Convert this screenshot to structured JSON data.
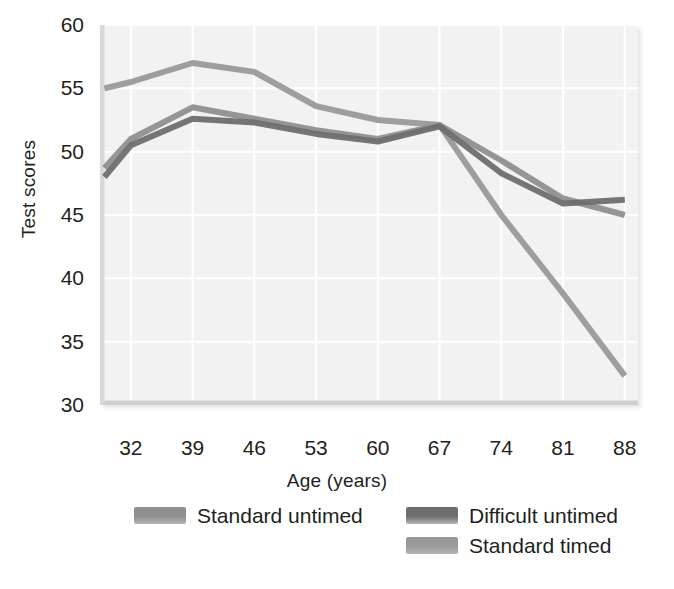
{
  "chart_data": {
    "type": "line",
    "title": "",
    "xlabel": "Age (years)",
    "ylabel": "Test scores",
    "x": [
      32,
      39,
      46,
      53,
      60,
      67,
      74,
      81,
      88
    ],
    "categories": [
      "32",
      "39",
      "46",
      "53",
      "60",
      "67",
      "74",
      "81",
      "88"
    ],
    "xlim": [
      28.5,
      89.5
    ],
    "ylim": [
      30,
      60
    ],
    "yticks": [
      30,
      35,
      40,
      45,
      50,
      55,
      60
    ],
    "ytick_labels": [
      "30",
      "35",
      "40",
      "45",
      "50",
      "55",
      "60"
    ],
    "grid": true,
    "legend_position": "below",
    "series": [
      {
        "name": "Standard untimed",
        "color": "#8f8f8f",
        "x_start": 29,
        "values_at_start": 48.7,
        "values": [
          51.0,
          53.5,
          52.6,
          51.7,
          51.0,
          52.1,
          49.3,
          46.3,
          45.0
        ]
      },
      {
        "name": "Difficult untimed",
        "color": "#6e6e6e",
        "x_start": 29,
        "values_at_start": 48.0,
        "values": [
          50.5,
          52.6,
          52.3,
          51.4,
          50.8,
          52.0,
          48.3,
          45.9,
          46.2
        ]
      },
      {
        "name": "Standard timed",
        "color": "#999999",
        "x_start": 29,
        "values_at_start": 55.0,
        "values": [
          55.5,
          57.0,
          56.3,
          53.6,
          52.5,
          52.1,
          45.0,
          38.8,
          32.3
        ]
      }
    ]
  },
  "axes": {
    "y_title": "Test scores",
    "x_title": "Age (years)"
  },
  "legend": {
    "entries": [
      {
        "label": "Standard untimed",
        "color": "#8f8f8f"
      },
      {
        "label": "Difficult untimed",
        "color": "#6e6e6e"
      },
      {
        "label": "Standard timed",
        "color": "#999999"
      }
    ]
  },
  "colors": {
    "plot_background": "#f2f2f2",
    "grid": "#ffffff",
    "text": "#231f20"
  }
}
